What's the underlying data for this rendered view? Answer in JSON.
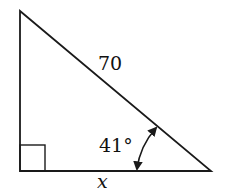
{
  "diagram": {
    "type": "right-triangle",
    "hypotenuse_label": "70",
    "angle_label": "41°",
    "base_label": "x",
    "right_angle_marker": true,
    "stroke_color": "#1a1a1a",
    "background": "#ffffff"
  }
}
